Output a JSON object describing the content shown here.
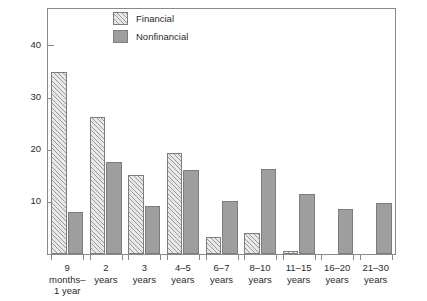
{
  "chart_data": {
    "type": "bar",
    "title": "",
    "xlabel": "",
    "ylabel": "Percent of total",
    "ylim": [
      0,
      47
    ],
    "yticks": [
      10,
      20,
      30,
      40
    ],
    "ytick_labels": [
      "10",
      "20",
      "30",
      "40"
    ],
    "grid": false,
    "legend_position": "top-center",
    "categories": [
      "9\nmonths–\n1 year",
      "2\nyears",
      "3\nyears",
      "4–5\nyears",
      "6–7\nyears",
      "8–10\nyears",
      "11–15\nyears",
      "16–20\nyears",
      "21–30\nyears"
    ],
    "series": [
      {
        "name": "Financial",
        "color": "#e8e8e8",
        "pattern": "diagonal-hatch",
        "values": [
          35.0,
          26.3,
          15.1,
          19.4,
          3.3,
          4.0,
          0.5,
          0,
          0
        ]
      },
      {
        "name": "Nonfinancial",
        "color": "#9e9e9e",
        "pattern": "solid",
        "values": [
          8.1,
          17.6,
          9.3,
          16.2,
          10.2,
          16.4,
          11.5,
          8.7,
          9.7
        ]
      }
    ]
  },
  "legend": {
    "items": [
      {
        "label": "Financial"
      },
      {
        "label": "Nonfinancial"
      }
    ]
  }
}
